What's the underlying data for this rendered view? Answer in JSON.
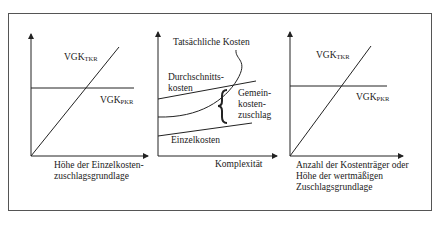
{
  "panels": [
    {
      "id": "left",
      "line_labels": {
        "tkr": {
          "main": "VGK",
          "sub": "TKR"
        },
        "pkr": {
          "main": "VGK",
          "sub": "PKR"
        }
      },
      "xlabel_line1": "Höhe der Einzelkosten-",
      "xlabel_line2": "zuschlagsgrundlage"
    },
    {
      "id": "middle",
      "curve_labels": {
        "actual": "Tatsächliche Kosten",
        "average_line1": "Durchschnitts-",
        "average_line2": "kosten",
        "overhead_line1": "Gemein-",
        "overhead_line2": "kosten-",
        "overhead_line3": "zuschlag",
        "direct": "Einzelkosten"
      },
      "xlabel": "Komplexität"
    },
    {
      "id": "right",
      "line_labels": {
        "tkr": {
          "main": "VGK",
          "sub": "TKR"
        },
        "pkr": {
          "main": "VGK",
          "sub": "PKR"
        }
      },
      "xlabel_line1": "Anzahl der Kostenträger oder",
      "xlabel_line2": "Höhe der wertmäßigen",
      "xlabel_line3": "Zuschlagsgrundlage"
    }
  ],
  "colors": {
    "line": "#222222",
    "frame": "#555555"
  }
}
